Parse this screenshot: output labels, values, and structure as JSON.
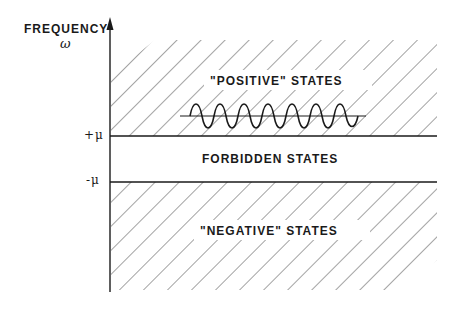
{
  "axis": {
    "title": "FREQUENCY",
    "symbol": "ω"
  },
  "ticks": {
    "upper": "+μ",
    "lower": "-μ"
  },
  "regions": {
    "positive": "\"POSITIVE\" STATES",
    "forbidden": "FORBIDDEN STATES",
    "negative": "\"NEGATIVE\" STATES"
  },
  "colors": {
    "line": "#1a1a1a",
    "hatch": "#555555",
    "background": "#ffffff"
  }
}
